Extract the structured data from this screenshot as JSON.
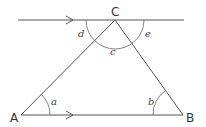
{
  "diagram": {
    "vertices": {
      "A": {
        "label": "A",
        "x": 21,
        "y": 115
      },
      "B": {
        "label": "B",
        "x": 183,
        "y": 115
      },
      "C": {
        "label": "C",
        "x": 115,
        "y": 20
      }
    },
    "angles": {
      "a": {
        "label": "a",
        "at": "A"
      },
      "b": {
        "label": "b",
        "at": "B"
      },
      "c": {
        "label": "c",
        "at": "C",
        "position": "interior"
      },
      "d": {
        "label": "d",
        "at": "C",
        "position": "left of CA"
      },
      "e": {
        "label": "e",
        "at": "C",
        "position": "right of CB"
      }
    },
    "parallel_lines": [
      "line through C",
      "AB"
    ],
    "colors": {
      "stroke": "#555555",
      "text": "#333333",
      "background": "#ffffff"
    }
  }
}
